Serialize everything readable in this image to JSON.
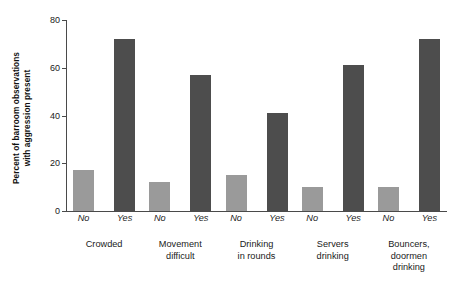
{
  "chart_data": {
    "type": "bar",
    "title": "",
    "xlabel": "",
    "ylabel": "Percent of barroom observations with aggression present",
    "ylabel_line1": "Percent of barroom observations",
    "ylabel_line2": "with aggression present",
    "ylim": [
      0,
      80
    ],
    "yticks": [
      0,
      20,
      40,
      60,
      80
    ],
    "ytick_labels": [
      "0",
      "20",
      "40",
      "60",
      "80"
    ],
    "grid": false,
    "legend": "none",
    "categories": [
      "Crowded",
      "Movement difficult",
      "Drinking in rounds",
      "Servers drinking",
      "Bouncers, doormen drinking"
    ],
    "category_label_lines": [
      [
        "Crowded"
      ],
      [
        "Movement",
        "difficult"
      ],
      [
        "Drinking",
        "in rounds"
      ],
      [
        "Servers",
        "drinking"
      ],
      [
        "Bouncers,",
        "doormen",
        "drinking"
      ]
    ],
    "sub_categories": [
      "No",
      "Yes"
    ],
    "series": [
      {
        "name": "No",
        "color": "#9a9a9a",
        "values": [
          17,
          12,
          15,
          10,
          10
        ]
      },
      {
        "name": "Yes",
        "color": "#4d4d4d",
        "values": [
          72,
          57,
          41,
          61,
          72
        ]
      }
    ],
    "groups": [
      {
        "label_lines": [
          "Crowded"
        ],
        "bars": [
          {
            "sub": "No",
            "value": 17
          },
          {
            "sub": "Yes",
            "value": 72
          }
        ]
      },
      {
        "label_lines": [
          "Movement",
          "difficult"
        ],
        "bars": [
          {
            "sub": "No",
            "value": 12
          },
          {
            "sub": "Yes",
            "value": 57
          }
        ]
      },
      {
        "label_lines": [
          "Drinking",
          "in rounds"
        ],
        "bars": [
          {
            "sub": "No",
            "value": 15
          },
          {
            "sub": "Yes",
            "value": 41
          }
        ]
      },
      {
        "label_lines": [
          "Servers",
          "drinking"
        ],
        "bars": [
          {
            "sub": "No",
            "value": 10
          },
          {
            "sub": "Yes",
            "value": 61
          }
        ]
      },
      {
        "label_lines": [
          "Bouncers,",
          "doormen",
          "drinking"
        ],
        "bars": [
          {
            "sub": "No",
            "value": 10
          },
          {
            "sub": "Yes",
            "value": 72
          }
        ]
      }
    ],
    "colors": {
      "bar_no": "#9a9a9a",
      "bar_yes": "#4d4d4d",
      "axis": "#4a4a4a",
      "text": "#1a1a1a",
      "background": "#ffffff"
    }
  }
}
